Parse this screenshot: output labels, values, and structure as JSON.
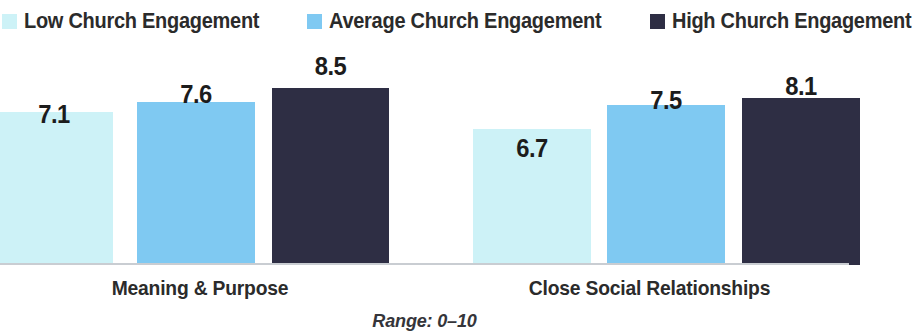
{
  "legend": {
    "items": [
      {
        "label": "Low Church Engagement",
        "color": "#cdf2f7",
        "swatch_icon": "square-swatch-icon"
      },
      {
        "label": "Average Church Engagement",
        "color": "#7fc9f2",
        "swatch_icon": "square-swatch-icon"
      },
      {
        "label": "High Church Engagement",
        "color": "#2e2e44",
        "swatch_icon": "square-swatch-icon"
      }
    ]
  },
  "footnote": "Range: 0–10",
  "chart_data": {
    "type": "bar",
    "title": "",
    "subtitle": "",
    "xlabel": "",
    "ylabel": "",
    "ylim": [
      0,
      10
    ],
    "grid": false,
    "legend_position": "top-left",
    "categories": [
      "Meaning & Purpose",
      "Close Social Relationships"
    ],
    "series": [
      {
        "name": "Low Church Engagement",
        "color": "#cdf2f7",
        "values": [
          7.1,
          6.7
        ]
      },
      {
        "name": "Average Church Engagement",
        "color": "#7fc9f2",
        "values": [
          7.6,
          7.5
        ]
      },
      {
        "name": "High Church Engagement",
        "color": "#2e2e44",
        "values": [
          8.5,
          8.1
        ]
      }
    ],
    "value_labels": [
      "7.1",
      "7.6",
      "8.5",
      "6.7",
      "7.5",
      "8.1"
    ],
    "annotations": [
      "Range: 0–10"
    ]
  },
  "bars": [
    {
      "value": "7.1",
      "color": "#cdf2f7",
      "left": -5,
      "width": 118,
      "top": 65,
      "height": 153,
      "label_top": 20
    },
    {
      "value": "7.6",
      "color": "#7fc9f2",
      "left": 137,
      "width": 118,
      "top": 55,
      "height": 163,
      "label_top": 10
    },
    {
      "value": "8.5",
      "color": "#2e2e44",
      "left": 272,
      "width": 117,
      "top": 41,
      "height": 177,
      "label_top": -4
    },
    {
      "value": "6.7",
      "color": "#cdf2f7",
      "left": 473,
      "width": 118,
      "top": 82,
      "height": 136,
      "label_top": 37
    },
    {
      "value": "7.5",
      "color": "#7fc9f2",
      "left": 607,
      "width": 118,
      "top": 58,
      "height": 160,
      "label_top": 13
    },
    {
      "value": "8.1",
      "color": "#2e2e44",
      "left": 742,
      "width": 118,
      "top": 51,
      "height": 167,
      "label_top": 6
    }
  ]
}
